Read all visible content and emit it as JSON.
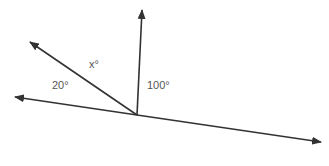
{
  "diagram": {
    "vertex": {
      "x": 137,
      "y": 115
    },
    "rays": [
      {
        "name": "ray-up",
        "tip": {
          "x": 142,
          "y": 10
        }
      },
      {
        "name": "ray-upper-left",
        "tip": {
          "x": 30,
          "y": 42
        }
      },
      {
        "name": "ray-left",
        "tip": {
          "x": 15,
          "y": 97
        }
      },
      {
        "name": "ray-right",
        "tip": {
          "x": 321,
          "y": 142
        }
      }
    ],
    "labels": {
      "x_angle": "x°",
      "angle_20": "20°",
      "angle_100": "100°"
    },
    "line_color": "#333333",
    "text_color": "#555555"
  }
}
